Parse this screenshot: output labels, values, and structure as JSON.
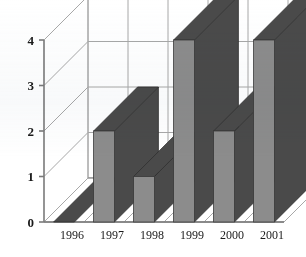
{
  "chart_data": {
    "type": "bar",
    "style": "3d-column",
    "title": "",
    "subtitle": "",
    "xlabel": "",
    "ylabel": "",
    "categories": [
      "1996",
      "1997",
      "1998",
      "1999",
      "2000",
      "2001"
    ],
    "values": [
      0,
      2,
      1,
      4,
      2,
      4
    ],
    "series": [
      {
        "name": "",
        "values": [
          0,
          2,
          1,
          4,
          2,
          4
        ]
      }
    ],
    "ylim": [
      0,
      4
    ],
    "ytick_labels": [
      "0",
      "1",
      "2",
      "3",
      "4"
    ],
    "ytick_values": [
      0,
      1,
      2,
      3,
      4
    ],
    "grid": true,
    "grid_axis": "y",
    "legend": false,
    "legend_position": "none",
    "annotations": []
  },
  "colors": {
    "bar_front": "#8c8c8c",
    "bar_side": "#4a4a4a",
    "bar_top": "#4a4a4a",
    "grid_line": "#a8a8a8",
    "axis_line": "#7a7a7a",
    "plot_background": "#ffffff",
    "text": "#1a1a1a"
  },
  "axes": {
    "y_axis_name": "value-axis",
    "x_axis_name": "year-axis"
  }
}
